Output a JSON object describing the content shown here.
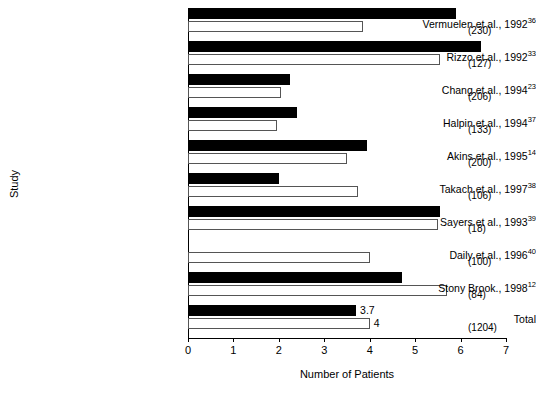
{
  "chart_data": {
    "type": "bar",
    "orientation": "horizontal",
    "title": "",
    "xlabel": "Number of Patients",
    "ylabel": "Study",
    "xlim": [
      0,
      7
    ],
    "xticks": [
      0,
      1,
      2,
      3,
      4,
      5,
      6,
      7
    ],
    "grid": false,
    "legend": null,
    "categories": [
      "Vermuelen et al., 1992",
      "Rizzo et al., 1992",
      "Chang et al., 1994",
      "Halpin et al., 1994",
      "Akins et al., 1995",
      "Takach et al., 1997",
      "Sayers et al., 1993",
      "Daily et al., 1996",
      "Stony Brook., 1998",
      "Total"
    ],
    "category_superscripts": [
      "36",
      "33",
      "23",
      "37",
      "14",
      "38",
      "39",
      "40",
      "12",
      ""
    ],
    "series": [
      {
        "name": "black",
        "values": [
          5.9,
          6.45,
          2.25,
          2.4,
          3.95,
          2.0,
          5.55,
          0,
          4.7,
          3.7
        ]
      },
      {
        "name": "white",
        "values": [
          3.85,
          5.55,
          2.05,
          1.95,
          3.5,
          3.75,
          5.5,
          4.0,
          5.7,
          4.0
        ]
      }
    ],
    "annotations": [
      {
        "row": 9,
        "series": "black",
        "text": "3.7"
      },
      {
        "row": 9,
        "series": "white",
        "text": "4"
      }
    ],
    "right_labels": [
      "(230)",
      "(127)",
      "(206)",
      "(133)",
      "(200)",
      "(106)",
      "(18)",
      "(100)",
      "(84)",
      "(1204)"
    ],
    "colors": {
      "black_series": "#000000",
      "white_series": "#ffffff",
      "white_series_border": "#555555",
      "axis": "#000000",
      "text": "#000000",
      "background": "#ffffff"
    }
  }
}
